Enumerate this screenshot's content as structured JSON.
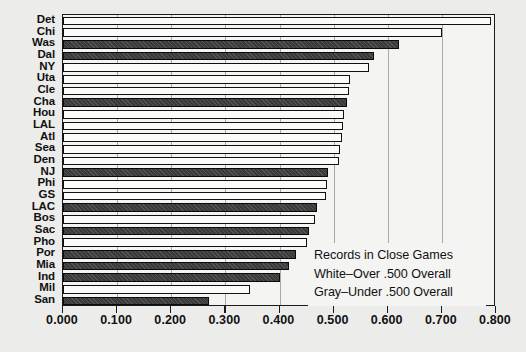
{
  "chart_data": {
    "type": "bar",
    "orientation": "horizontal",
    "title": "Records in Close Games",
    "xlabel": "",
    "ylabel": "",
    "xlim": [
      0.0,
      0.8
    ],
    "xticks": [
      "0.000",
      "0.100",
      "0.200",
      "0.300",
      "0.400",
      "0.500",
      "0.600",
      "0.700",
      "0.800"
    ],
    "xtick_values": [
      0.0,
      0.1,
      0.2,
      0.3,
      0.4,
      0.5,
      0.6,
      0.7,
      0.8
    ],
    "grid": true,
    "grid_axis": "x",
    "legend_position": "lower-right",
    "categories": [
      "Det",
      "Chi",
      "Was",
      "Dal",
      "NY",
      "Uta",
      "Cle",
      "Cha",
      "Hou",
      "LAL",
      "Atl",
      "Sea",
      "Den",
      "NJ",
      "Phi",
      "GS",
      "LAC",
      "Bos",
      "Sac",
      "Pho",
      "Por",
      "Mia",
      "Ind",
      "Mil",
      "San"
    ],
    "values": [
      0.79,
      0.7,
      0.62,
      0.575,
      0.565,
      0.53,
      0.528,
      0.525,
      0.52,
      0.518,
      0.515,
      0.512,
      0.51,
      0.49,
      0.488,
      0.485,
      0.47,
      0.465,
      0.455,
      0.45,
      0.43,
      0.418,
      0.4,
      0.345,
      0.27
    ],
    "groups": [
      "white",
      "white",
      "gray",
      "gray",
      "white",
      "white",
      "white",
      "gray",
      "white",
      "white",
      "white",
      "white",
      "white",
      "gray",
      "white",
      "white",
      "gray",
      "white",
      "gray",
      "white",
      "gray",
      "gray",
      "gray",
      "white",
      "gray"
    ],
    "series": [
      {
        "name": "White-Over .500 Overall",
        "color": "#fbfbfa"
      },
      {
        "name": "Gray-Under .500 Overall",
        "color": "#3a3a3a"
      }
    ]
  },
  "legend": {
    "lines": [
      "Records in Close Games",
      "White–Over .500 Overall",
      "Gray–Under .500 Overall"
    ]
  }
}
